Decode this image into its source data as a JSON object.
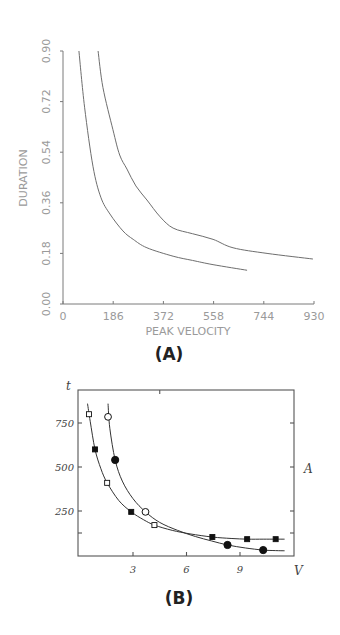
{
  "panels": {
    "a_label": "(A)",
    "b_label": "(B)"
  },
  "chart_data": [
    {
      "id": "A",
      "type": "line",
      "title": "",
      "xlabel": "PEAK VELOCITY",
      "ylabel": "DURATION",
      "xlim": [
        0,
        930
      ],
      "ylim": [
        0.0,
        0.9
      ],
      "xticks": [
        "0",
        "186",
        "372",
        "558",
        "744",
        "930"
      ],
      "yticks": [
        "0.00",
        "0.18",
        "0.36",
        "0.54",
        "0.72",
        "0.90"
      ],
      "grid": false,
      "legend": null,
      "series": [
        {
          "name": "lower curve",
          "x": [
            59,
            80,
            111,
            140,
            174,
            222,
            260,
            311,
            408,
            480,
            556,
            682
          ],
          "y": [
            0.9,
            0.7,
            0.49,
            0.38,
            0.32,
            0.26,
            0.23,
            0.2,
            0.17,
            0.155,
            0.14,
            0.12
          ]
        },
        {
          "name": "upper curve",
          "x": [
            130,
            148,
            185,
            210,
            237,
            270,
            311,
            360,
            408,
            480,
            556,
            630,
            756,
            926
          ],
          "y": [
            0.9,
            0.77,
            0.62,
            0.53,
            0.48,
            0.42,
            0.37,
            0.31,
            0.27,
            0.25,
            0.23,
            0.2,
            0.18,
            0.16
          ]
        }
      ]
    },
    {
      "id": "B",
      "type": "scatter",
      "title": "",
      "xlabel": "V",
      "ylabel": "t",
      "right_label": "A",
      "xlim": [
        0,
        12
      ],
      "ylim": [
        0,
        920
      ],
      "xticks": [
        "3",
        "6",
        "9"
      ],
      "yticks": [
        "250",
        "500",
        "750"
      ],
      "grid": false,
      "legend": null,
      "series": [
        {
          "name": "curve 1 (squares)",
          "marker": "square",
          "points": [
            {
              "x": 0.53,
              "y": 800,
              "filled": false
            },
            {
              "x": 0.87,
              "y": 600,
              "filled": true
            },
            {
              "x": 1.55,
              "y": 410,
              "filled": false
            },
            {
              "x": 2.9,
              "y": 245,
              "filled": true
            },
            {
              "x": 4.2,
              "y": 170,
              "filled": false
            },
            {
              "x": 7.45,
              "y": 102,
              "filled": true
            },
            {
              "x": 9.4,
              "y": 90,
              "filled": true
            },
            {
              "x": 11.0,
              "y": 90,
              "filled": true
            }
          ],
          "fit": {
            "x": [
              0.45,
              0.6,
              0.87,
              1.2,
              1.55,
              2.2,
              2.9,
              3.6,
              4.2,
              5.2,
              6.2,
              7.45,
              8.5,
              9.4,
              10.3,
              11.0,
              11.5
            ],
            "y": [
              860,
              760,
              600,
              490,
              410,
              310,
              245,
              200,
              170,
              140,
              120,
              102,
              94,
              90,
              90,
              90,
              90
            ]
          }
        },
        {
          "name": "curve 2 (circles)",
          "marker": "circle",
          "points": [
            {
              "x": 1.6,
              "y": 785,
              "filled": false
            },
            {
              "x": 2.0,
              "y": 540,
              "filled": true
            },
            {
              "x": 3.7,
              "y": 245,
              "filled": false
            },
            {
              "x": 8.3,
              "y": 57,
              "filled": true
            },
            {
              "x": 10.3,
              "y": 28,
              "filled": true
            }
          ],
          "fit": {
            "x": [
              1.6,
              1.7,
              2.0,
              2.4,
              3.0,
              3.7,
              4.5,
              5.5,
              6.5,
              7.4,
              8.3,
              9.3,
              10.3,
              11.0,
              11.5
            ],
            "y": [
              860,
              720,
              540,
              420,
              320,
              245,
              185,
              140,
              105,
              80,
              57,
              40,
              28,
              25,
              24
            ]
          }
        }
      ]
    }
  ]
}
